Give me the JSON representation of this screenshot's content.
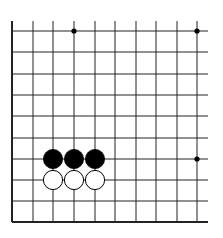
{
  "board": {
    "description": "Partial Go board (lower-left corner region)",
    "columns": 10,
    "rows": 10,
    "x_lines": [
      12,
      33,
      53,
      74,
      95,
      115,
      136,
      156,
      177,
      197
    ],
    "y_lines": [
      31,
      52,
      74,
      95,
      116,
      138,
      159,
      180,
      201,
      222
    ],
    "line_color": "#222222",
    "edge_left": true,
    "edge_bottom": true,
    "open_right_extent": 208,
    "open_top_extent": 21
  },
  "star_points": [
    {
      "col": 3,
      "row": 0
    },
    {
      "col": 9,
      "row": 0
    },
    {
      "col": 9,
      "row": 6
    }
  ],
  "stones": [
    {
      "color": "black",
      "col": 2,
      "row": 6
    },
    {
      "color": "black",
      "col": 3,
      "row": 6
    },
    {
      "color": "black",
      "col": 4,
      "row": 6
    },
    {
      "color": "white",
      "col": 2,
      "row": 7
    },
    {
      "color": "white",
      "col": 3,
      "row": 7
    },
    {
      "color": "white",
      "col": 4,
      "row": 7
    }
  ]
}
